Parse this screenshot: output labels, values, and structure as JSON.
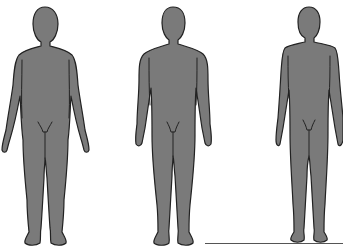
{
  "figure": {
    "background": "#ffffff",
    "fill_color": "#7a7a7a",
    "outline_color": "#222222",
    "ground_line_color": "#555555",
    "silhouettes": [
      {
        "id": "figure-1",
        "build": "broad",
        "center_x": 45
      },
      {
        "id": "figure-2",
        "build": "athletic",
        "center_x": 173
      },
      {
        "id": "figure-3",
        "build": "slender",
        "center_x": 309
      }
    ]
  }
}
